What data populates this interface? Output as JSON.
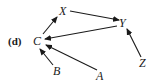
{
  "panel_label": "(d)",
  "nodes": {
    "C": {
      "label": "C"
    },
    "X": {
      "label": "X"
    },
    "Y": {
      "label": "Y"
    },
    "Z": {
      "label": "Z"
    },
    "B": {
      "label": "B"
    },
    "A": {
      "label": "A"
    }
  },
  "edges": [
    {
      "from": "C",
      "to": "X"
    },
    {
      "from": "X",
      "to": "Y"
    },
    {
      "from": "Y",
      "to": "C"
    },
    {
      "from": "Z",
      "to": "Y"
    },
    {
      "from": "B",
      "to": "C"
    },
    {
      "from": "A",
      "to": "C"
    }
  ],
  "colors": {
    "ink": "#1a1a1a",
    "background": "#ffffff"
  }
}
